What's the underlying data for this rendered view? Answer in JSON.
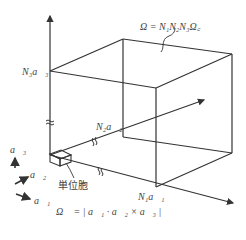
{
  "diagram": {
    "title_formula": "Ω = N₁N₂N₃Ω꜀",
    "labels": {
      "n3a3": "N₃a⃗₃",
      "n2a2": "N₂a⃗₂",
      "n1a1": "N₁a⃗₁",
      "unit_cell": "単位胞",
      "cell_volume": "Ω꜀ = | a⃗₁ · a⃗₂ × a⃗₃ |"
    },
    "legend": {
      "a3": "a⃗₃",
      "a2": "a⃗₂",
      "a1": "a⃗₁"
    },
    "colors": {
      "line": "#333333",
      "text": "#444444",
      "background": "#ffffff"
    }
  }
}
